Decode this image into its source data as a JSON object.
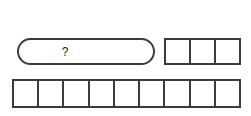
{
  "diagram": {
    "background_color": "#ffffff",
    "line_color": "#3b3b3b",
    "text_color": "#222222",
    "unknown_bar": {
      "label": "?",
      "shape": "stadium",
      "segments": 1
    },
    "top_strip": {
      "cell_count": 3,
      "cells": [
        "",
        "",
        ""
      ]
    },
    "bottom_strip": {
      "cell_count": 9,
      "cells": [
        "",
        "",
        "",
        "",
        "",
        "",
        "",
        "",
        ""
      ]
    }
  }
}
